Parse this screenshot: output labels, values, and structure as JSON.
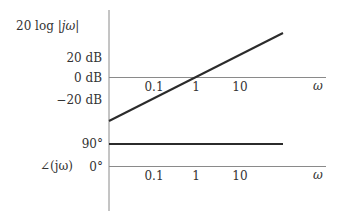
{
  "diagram": {
    "type": "bode_plot",
    "magnitude": {
      "ylabel": "20 log |jω|",
      "ylabel_parts": {
        "prefix": "20 log ",
        "bar_left": "|",
        "var": "jω",
        "bar_right": "|"
      },
      "ticks": [
        "20 dB",
        "0 dB",
        "−20 dB"
      ],
      "x_ticks": [
        "0.1",
        "1",
        "10"
      ],
      "x_label": "ω",
      "line": {
        "description": "straight line slope +20 dB/decade crossing 0 dB at ω=1"
      }
    },
    "phase": {
      "ylabel": "∠(jω)",
      "ticks": [
        "90°",
        "0°"
      ],
      "x_ticks": [
        "0.1",
        "1",
        "10"
      ],
      "x_label": "ω",
      "line": {
        "description": "constant 90° horizontal line"
      }
    },
    "colors": {
      "axis": "#8a8a8a",
      "curve": "#2b2b2b",
      "text": "#333333"
    }
  }
}
